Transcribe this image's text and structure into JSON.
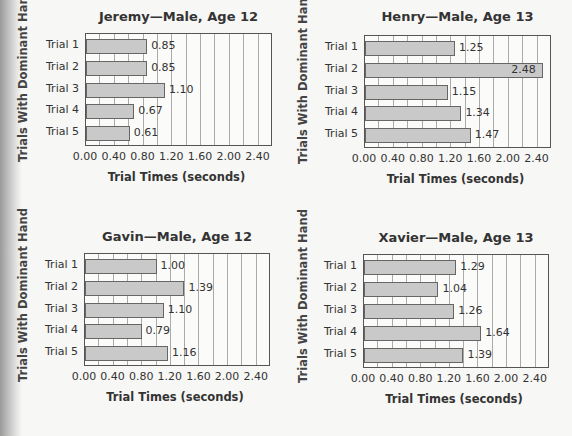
{
  "chart_data": [
    {
      "type": "bar",
      "orientation": "horizontal",
      "title": "Jeremy—Male, Age 12",
      "xlabel": "Trial Times (seconds)",
      "ylabel": "Trials With Dominant Hand",
      "categories": [
        "Trial 1",
        "Trial 2",
        "Trial 3",
        "Trial 4",
        "Trial 5"
      ],
      "values": [
        0.85,
        0.85,
        1.1,
        0.67,
        0.61
      ],
      "value_labels": [
        "0.85",
        "0.85",
        "1.10",
        "0.67",
        "0.61"
      ],
      "xticks": [
        "0.00",
        "0.40",
        "0.80",
        "1.20",
        "1.60",
        "2.00",
        "2.40"
      ],
      "xlim": [
        0,
        2.6
      ],
      "grid": true,
      "grid_step": 0.2
    },
    {
      "type": "bar",
      "orientation": "horizontal",
      "title": "Henry—Male, Age 13",
      "xlabel": "Trial Times (seconds)",
      "ylabel": "Trials With Dominant Hand",
      "categories": [
        "Trial 1",
        "Trial 2",
        "Trial 3",
        "Trial 4",
        "Trial 5"
      ],
      "values": [
        1.25,
        2.48,
        1.15,
        1.34,
        1.47
      ],
      "value_labels": [
        "1.25",
        "2.48",
        "1.15",
        "1.34",
        "1.47"
      ],
      "xticks": [
        "0.00",
        "0.40",
        "0.80",
        "1.20",
        "1.60",
        "2.00",
        "2.40"
      ],
      "xlim": [
        0,
        2.6
      ],
      "grid": true,
      "grid_step": 0.2
    },
    {
      "type": "bar",
      "orientation": "horizontal",
      "title": "Gavin—Male, Age 12",
      "xlabel": "Trial Times (seconds)",
      "ylabel": "Trials With Dominant Hand",
      "categories": [
        "Trial 1",
        "Trial 2",
        "Trial 3",
        "Trial 4",
        "Trial 5"
      ],
      "values": [
        1.0,
        1.39,
        1.1,
        0.79,
        1.16
      ],
      "value_labels": [
        "1.00",
        "1.39",
        "1.10",
        "0.79",
        "1.16"
      ],
      "xticks": [
        "0.00",
        "0.40",
        "0.80",
        "1.20",
        "1.60",
        "2.00",
        "2.40"
      ],
      "xlim": [
        0,
        2.6
      ],
      "grid": true,
      "grid_step": 0.2
    },
    {
      "type": "bar",
      "orientation": "horizontal",
      "title": "Xavier—Male, Age 13",
      "xlabel": "Trial Times (seconds)",
      "ylabel": "Trials With Dominant Hand",
      "categories": [
        "Trial 1",
        "Trial 2",
        "Trial 3",
        "Trial 4",
        "Trial 5"
      ],
      "values": [
        1.29,
        1.04,
        1.26,
        1.64,
        1.39
      ],
      "value_labels": [
        "1.29",
        "1.04",
        "1.26",
        "1.64",
        "1.39"
      ],
      "xticks": [
        "0.00",
        "0.40",
        "0.80",
        "1.20",
        "1.60",
        "2.00",
        "2.40"
      ],
      "xlim": [
        0,
        2.6
      ],
      "grid": true,
      "grid_step": 0.2
    }
  ],
  "colors": {
    "bar_fill": "#c9c9c9",
    "bar_border": "#666666",
    "frame": "#555555",
    "grid": "#aaaaaa"
  }
}
